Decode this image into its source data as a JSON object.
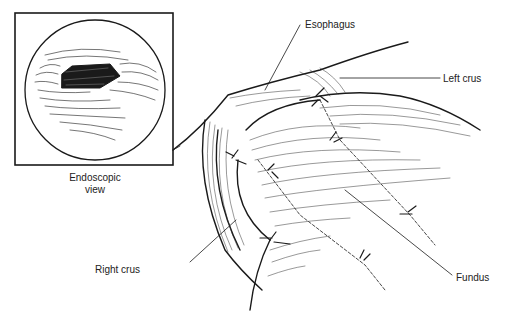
{
  "figure": {
    "inset": {
      "caption_line1": "Endoscopic",
      "caption_line2": "view"
    },
    "labels": {
      "esophagus": "Esophagus",
      "left_crus": "Left crus",
      "right_crus": "Right crus",
      "fundus": "Fundus"
    },
    "colors": {
      "ink": "#1a1a1a",
      "background": "#ffffff"
    }
  }
}
